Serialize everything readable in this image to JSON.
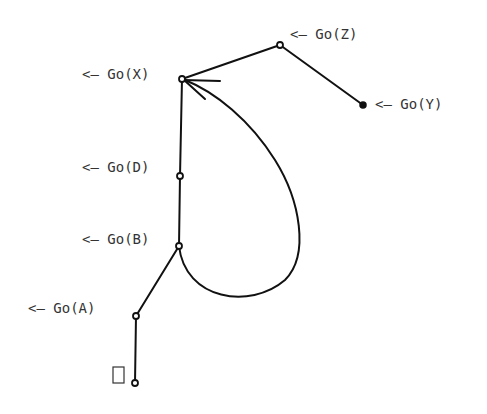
{
  "diagram": {
    "nodes": [
      {
        "id": "Z",
        "label": "<— Go(Z)",
        "x": 280,
        "y": 45,
        "filled": false
      },
      {
        "id": "X",
        "label": "<— Go(X)",
        "x": 182,
        "y": 79,
        "filled": false
      },
      {
        "id": "Y",
        "label": "<— Go(Y)",
        "x": 363,
        "y": 105,
        "filled": true
      },
      {
        "id": "D",
        "label": "<— Go(D)",
        "x": 180,
        "y": 176,
        "filled": false
      },
      {
        "id": "B",
        "label": "<— Go(B)",
        "x": 179,
        "y": 246,
        "filled": false
      },
      {
        "id": "A",
        "label": "<— Go(A)",
        "x": 136,
        "y": 316,
        "filled": false
      },
      {
        "id": "root",
        "label": "",
        "x": 135,
        "y": 383,
        "filled": false
      }
    ],
    "edges": [
      {
        "from": "Z",
        "to": "X"
      },
      {
        "from": "Z",
        "to": "Y"
      },
      {
        "from": "X",
        "to": "D"
      },
      {
        "from": "D",
        "to": "B"
      },
      {
        "from": "B",
        "to": "A"
      },
      {
        "from": "A",
        "to": "root"
      }
    ],
    "loop_arrow": {
      "from": "B",
      "to": "X"
    },
    "labels": {
      "z": "<— Go(Z)",
      "x": "<— Go(X)",
      "y": "<— Go(Y)",
      "d": "<— Go(D)",
      "b": "<— Go(B)",
      "a": "<— Go(A)"
    },
    "cursor_box": {
      "symbol": "□"
    }
  }
}
